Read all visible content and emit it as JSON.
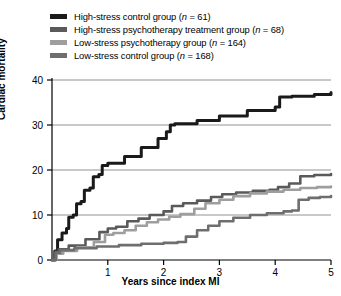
{
  "chart_data": {
    "type": "line",
    "title": "",
    "xlabel": "Years since index MI",
    "ylabel": "Cardiac mortality",
    "xlim": [
      0,
      5
    ],
    "ylim": [
      0,
      40
    ],
    "xticks": [
      "1",
      "2",
      "3",
      "4",
      "5"
    ],
    "xtick_values": [
      1,
      2,
      3,
      4,
      5
    ],
    "yticks": [
      "0",
      "10",
      "20",
      "30",
      "40"
    ],
    "ytick_values": [
      0,
      10,
      20,
      30,
      40
    ],
    "grid": "horizontal",
    "legend_position": "above-plot",
    "step_style": "step-like cumulative mortality curves",
    "series": [
      {
        "name": "High-stress control group (n = 61)",
        "label_main": "High-stress control group (",
        "label_italic": "n",
        "label_tail": " = 61)",
        "n": 61,
        "color": "#1a1a1a",
        "points": [
          [
            0.0,
            0.0
          ],
          [
            0.05,
            2.0
          ],
          [
            0.1,
            4.5
          ],
          [
            0.18,
            6.0
          ],
          [
            0.26,
            7.0
          ],
          [
            0.3,
            9.5
          ],
          [
            0.38,
            10.0
          ],
          [
            0.44,
            12.5
          ],
          [
            0.52,
            13.0
          ],
          [
            0.58,
            15.5
          ],
          [
            0.68,
            16.0
          ],
          [
            0.74,
            18.5
          ],
          [
            0.84,
            19.0
          ],
          [
            0.9,
            21.0
          ],
          [
            1.0,
            21.5
          ],
          [
            1.3,
            23.0
          ],
          [
            1.6,
            25.0
          ],
          [
            1.9,
            27.0
          ],
          [
            2.05,
            28.5
          ],
          [
            2.12,
            30.0
          ],
          [
            2.2,
            30.3
          ],
          [
            2.6,
            31.0
          ],
          [
            3.0,
            32.0
          ],
          [
            3.5,
            33.2
          ],
          [
            4.0,
            34.0
          ],
          [
            4.08,
            36.2
          ],
          [
            4.3,
            36.4
          ],
          [
            4.7,
            36.8
          ],
          [
            5.0,
            37.2
          ]
        ]
      },
      {
        "name": "High-stress psychotherapy treatment group (n = 68)",
        "label_main": "High-stress psychotherapy treatment group (",
        "label_italic": "n",
        "label_tail": " = 68)",
        "n": 68,
        "color": "#5a5a5a",
        "points": [
          [
            0.0,
            0.0
          ],
          [
            0.06,
            1.8
          ],
          [
            0.12,
            2.4
          ],
          [
            0.3,
            3.2
          ],
          [
            0.6,
            4.6
          ],
          [
            0.85,
            6.2
          ],
          [
            1.0,
            7.0
          ],
          [
            1.15,
            7.4
          ],
          [
            1.35,
            8.6
          ],
          [
            1.55,
            9.2
          ],
          [
            1.75,
            10.0
          ],
          [
            2.0,
            10.8
          ],
          [
            2.15,
            12.0
          ],
          [
            2.35,
            12.6
          ],
          [
            2.6,
            13.2
          ],
          [
            2.85,
            14.0
          ],
          [
            3.05,
            14.6
          ],
          [
            3.3,
            15.0
          ],
          [
            3.6,
            15.4
          ],
          [
            3.9,
            15.6
          ],
          [
            4.05,
            16.2
          ],
          [
            4.25,
            17.0
          ],
          [
            4.45,
            18.6
          ],
          [
            4.7,
            18.9
          ],
          [
            5.0,
            19.1
          ]
        ]
      },
      {
        "name": "Low-stress psychotherapy group (n = 164)",
        "label_main": "Low-stress psychotherapy group (",
        "label_italic": "n",
        "label_tail": " = 164)",
        "n": 164,
        "color": "#9e9e9e",
        "points": [
          [
            0.0,
            0.0
          ],
          [
            0.08,
            1.4
          ],
          [
            0.2,
            2.0
          ],
          [
            0.45,
            2.8
          ],
          [
            0.75,
            4.0
          ],
          [
            0.95,
            5.6
          ],
          [
            1.1,
            6.0
          ],
          [
            1.3,
            6.6
          ],
          [
            1.5,
            7.6
          ],
          [
            1.7,
            8.4
          ],
          [
            1.9,
            9.0
          ],
          [
            2.1,
            9.6
          ],
          [
            2.3,
            10.2
          ],
          [
            2.55,
            11.4
          ],
          [
            2.75,
            12.6
          ],
          [
            3.0,
            13.4
          ],
          [
            3.25,
            14.2
          ],
          [
            3.55,
            14.8
          ],
          [
            3.85,
            15.2
          ],
          [
            4.15,
            15.6
          ],
          [
            4.45,
            16.0
          ],
          [
            4.75,
            16.2
          ],
          [
            5.0,
            16.3
          ]
        ]
      },
      {
        "name": "Low-stress control group (n = 168)",
        "label_main": "Low-stress control group (",
        "label_italic": "n",
        "label_tail": " = 168)",
        "n": 168,
        "color": "#6e6e6e",
        "points": [
          [
            0.0,
            0.0
          ],
          [
            0.07,
            1.6
          ],
          [
            0.15,
            2.2
          ],
          [
            0.4,
            2.6
          ],
          [
            0.8,
            3.0
          ],
          [
            1.2,
            3.3
          ],
          [
            1.6,
            3.6
          ],
          [
            2.0,
            3.8
          ],
          [
            2.25,
            4.0
          ],
          [
            2.4,
            5.2
          ],
          [
            2.6,
            6.6
          ],
          [
            2.8,
            7.6
          ],
          [
            3.0,
            8.6
          ],
          [
            3.25,
            9.4
          ],
          [
            3.55,
            10.0
          ],
          [
            3.85,
            10.4
          ],
          [
            4.15,
            10.8
          ],
          [
            4.3,
            11.0
          ],
          [
            4.42,
            13.4
          ],
          [
            4.6,
            13.8
          ],
          [
            4.8,
            14.0
          ],
          [
            5.0,
            14.2
          ]
        ]
      }
    ]
  },
  "axis": {
    "y_title": "Cardiac mortality",
    "x_title": "Years since index MI"
  }
}
